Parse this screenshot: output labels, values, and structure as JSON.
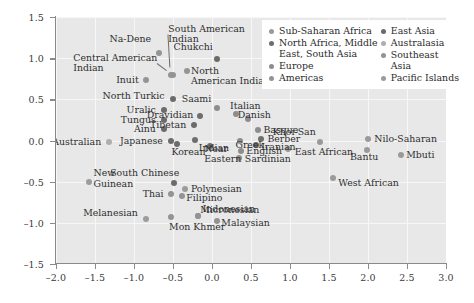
{
  "chart_data": {
    "type": "scatter",
    "title": "",
    "xlabel": "",
    "ylabel": "",
    "xlim": [
      -2.0,
      3.0
    ],
    "ylim": [
      -1.5,
      1.5
    ],
    "xticks": [
      "-2.0",
      "-1.5",
      "-1.0",
      "-0.5",
      "0.0",
      "0.5",
      "1.0",
      "1.5",
      "2.0",
      "2.5",
      "3.0"
    ],
    "yticks": [
      "1.5",
      "1.0",
      "0.5",
      "0.0",
      "-0.5",
      "-1.0",
      "-1.5"
    ],
    "grid": true,
    "legend_position": "top-right",
    "legend": [
      {
        "label": "Sub-Saharan Africa",
        "color": "#9a9a9a"
      },
      {
        "label": "North Africa, Middle\nEast, South Asia",
        "color": "#6e6e6e"
      },
      {
        "label": "Europe",
        "color": "#8d8d8d"
      },
      {
        "label": "Americas",
        "color": "#949494"
      },
      {
        "label": "East Asia",
        "color": "#6b6b6b"
      },
      {
        "label": "Australasia",
        "color": "#aeaeae"
      },
      {
        "label": "Southeast Asia",
        "color": "#939393"
      },
      {
        "label": "Pacific Islands",
        "color": "#9c9c9c"
      }
    ],
    "points": [
      {
        "label": "Na-Dene",
        "x": -0.68,
        "y": 1.06,
        "lx": -0.78,
        "ly": 1.23,
        "anchor": "r",
        "group": "Americas"
      },
      {
        "label": "South American\nIndian",
        "x": -0.53,
        "y": 0.8,
        "lx": -0.56,
        "ly": 1.29,
        "anchor": "l",
        "group": "Americas"
      },
      {
        "label": "Central American\nIndian",
        "x": -0.5,
        "y": 0.8,
        "lx": -0.7,
        "ly": 0.94,
        "anchor": "r",
        "group": "Americas"
      },
      {
        "label": "Inuit",
        "x": -0.85,
        "y": 0.74,
        "lx": -0.94,
        "ly": 0.74,
        "anchor": "r",
        "group": "Americas"
      },
      {
        "label": "Chukchi",
        "x": 0.06,
        "y": 0.99,
        "lx": 0.01,
        "ly": 1.13,
        "anchor": "r",
        "group": "East Asia"
      },
      {
        "label": "North\nAmerican Indian",
        "x": -0.32,
        "y": 0.85,
        "lx": -0.27,
        "ly": 0.78,
        "anchor": "l",
        "group": "Americas"
      },
      {
        "label": "North Turkic",
        "x": -0.5,
        "y": 0.51,
        "lx": -0.61,
        "ly": 0.54,
        "anchor": "r",
        "group": "East Asia"
      },
      {
        "label": "Saami",
        "x": 0.06,
        "y": 0.4,
        "lx": -0.01,
        "ly": 0.51,
        "anchor": "r",
        "group": "Europe"
      },
      {
        "label": "Italian",
        "x": 0.31,
        "y": 0.32,
        "lx": 0.23,
        "ly": 0.42,
        "anchor": "l",
        "group": "Europe"
      },
      {
        "label": "Danish",
        "x": 0.46,
        "y": 0.26,
        "lx": 0.33,
        "ly": 0.31,
        "anchor": "l",
        "group": "Europe"
      },
      {
        "label": "Uralic",
        "x": -0.62,
        "y": 0.37,
        "lx": -0.72,
        "ly": 0.37,
        "anchor": "r",
        "group": "East Asia"
      },
      {
        "label": "Dravidian",
        "x": -0.16,
        "y": 0.3,
        "lx": -0.24,
        "ly": 0.31,
        "anchor": "r",
        "group": "North Africa, Middle East, South Asia"
      },
      {
        "label": "Tungus",
        "x": -0.62,
        "y": 0.25,
        "lx": -0.72,
        "ly": 0.25,
        "anchor": "r",
        "group": "East Asia"
      },
      {
        "label": "Tibetan",
        "x": -0.23,
        "y": 0.19,
        "lx": -0.33,
        "ly": 0.19,
        "anchor": "r",
        "group": "East Asia"
      },
      {
        "label": "Ainu",
        "x": -0.62,
        "y": 0.14,
        "lx": -0.72,
        "ly": 0.14,
        "anchor": "r",
        "group": "East Asia"
      },
      {
        "label": "Basque",
        "x": 0.59,
        "y": 0.13,
        "lx": 0.66,
        "ly": 0.13,
        "anchor": "l",
        "group": "Europe"
      },
      {
        "label": "Berber",
        "x": 0.63,
        "y": 0.02,
        "lx": 0.71,
        "ly": 0.02,
        "anchor": "l",
        "group": "North Africa, Middle East, South Asia"
      },
      {
        "label": "Iranian",
        "x": 0.57,
        "y": -0.05,
        "lx": 0.63,
        "ly": -0.08,
        "anchor": "l",
        "group": "North Africa, Middle East, South Asia"
      },
      {
        "label": "Japanese",
        "x": -0.53,
        "y": 0.0,
        "lx": -0.63,
        "ly": 0.0,
        "anchor": "r",
        "group": "East Asia"
      },
      {
        "label": "Australian",
        "x": -1.32,
        "y": -0.02,
        "lx": -1.42,
        "ly": -0.02,
        "anchor": "r",
        "group": "Australasia"
      },
      {
        "label": "Indian",
        "x": -0.22,
        "y": 0.01,
        "lx": -0.17,
        "ly": -0.09,
        "anchor": "l",
        "group": "North Africa, Middle East, South Asia"
      },
      {
        "label": "Greek",
        "x": 0.36,
        "y": 0.0,
        "lx": 0.3,
        "ly": -0.06,
        "anchor": "l",
        "group": "Europe"
      },
      {
        "label": "Khoi-San",
        "x": 1.38,
        "y": -0.02,
        "lx": 1.33,
        "ly": 0.1,
        "anchor": "r",
        "group": "Sub-Saharan Africa"
      },
      {
        "label": "Nilo-Saharan",
        "x": 2.0,
        "y": 0.02,
        "lx": 2.08,
        "ly": 0.02,
        "anchor": "l",
        "group": "Sub-Saharan Africa"
      },
      {
        "label": "Korean",
        "x": -0.45,
        "y": -0.04,
        "lx": -0.52,
        "ly": -0.14,
        "anchor": "l",
        "group": "East Asia"
      },
      {
        "label": "Near\nEastern",
        "x": -0.02,
        "y": -0.07,
        "lx": -0.1,
        "ly": -0.16,
        "anchor": "l",
        "group": "North Africa, Middle East, South Asia"
      },
      {
        "label": "English",
        "x": 0.37,
        "y": -0.13,
        "lx": 0.44,
        "ly": -0.13,
        "anchor": "l",
        "group": "Europe"
      },
      {
        "label": "Sardinian",
        "x": 0.34,
        "y": -0.21,
        "lx": 0.42,
        "ly": -0.22,
        "anchor": "l",
        "group": "Europe"
      },
      {
        "label": "East African",
        "x": 0.98,
        "y": -0.1,
        "lx": 1.06,
        "ly": -0.14,
        "anchor": "l",
        "group": "Sub-Saharan Africa"
      },
      {
        "label": "Bantu",
        "x": 1.99,
        "y": -0.12,
        "lx": 1.95,
        "ly": -0.2,
        "anchor": "c",
        "group": "Sub-Saharan Africa"
      },
      {
        "label": "Mbuti",
        "x": 2.42,
        "y": -0.17,
        "lx": 2.49,
        "ly": -0.17,
        "anchor": "l",
        "group": "Sub-Saharan Africa"
      },
      {
        "label": "New\nGuinean",
        "x": -1.58,
        "y": -0.5,
        "lx": -1.52,
        "ly": -0.46,
        "anchor": "l",
        "group": "Pacific Islands"
      },
      {
        "label": "South Chinese",
        "x": -0.49,
        "y": -0.52,
        "lx": -0.42,
        "ly": -0.4,
        "anchor": "r",
        "group": "East Asia"
      },
      {
        "label": "Polynesian",
        "x": -0.34,
        "y": -0.59,
        "lx": -0.27,
        "ly": -0.59,
        "anchor": "l",
        "group": "Pacific Islands"
      },
      {
        "label": "Thai",
        "x": -0.53,
        "y": -0.65,
        "lx": -0.62,
        "ly": -0.65,
        "anchor": "r",
        "group": "Southeast Asia"
      },
      {
        "label": "Filipino",
        "x": -0.38,
        "y": -0.68,
        "lx": -0.33,
        "ly": -0.7,
        "anchor": "l",
        "group": "Southeast Asia"
      },
      {
        "label": "West African",
        "x": 1.55,
        "y": -0.45,
        "lx": 1.62,
        "ly": -0.52,
        "anchor": "l",
        "group": "Sub-Saharan Africa"
      },
      {
        "label": "Micronesian",
        "x": -0.18,
        "y": -0.92,
        "lx": -0.15,
        "ly": -0.84,
        "anchor": "l",
        "group": "Pacific Islands"
      },
      {
        "label": "Indonesian",
        "x": -0.18,
        "y": -0.92,
        "lx": -0.12,
        "ly": -0.83,
        "anchor": "l",
        "group": "Southeast Asia"
      },
      {
        "label": "Melanesian",
        "x": -0.85,
        "y": -0.95,
        "lx": -0.95,
        "ly": -0.88,
        "anchor": "r",
        "group": "Pacific Islands"
      },
      {
        "label": "Mon Khmer",
        "x": -0.52,
        "y": -0.93,
        "lx": -0.55,
        "ly": -1.05,
        "anchor": "l",
        "group": "Southeast Asia"
      },
      {
        "label": "Malaysian",
        "x": 0.06,
        "y": -0.98,
        "lx": 0.12,
        "ly": -1.0,
        "anchor": "l",
        "group": "Southeast Asia"
      }
    ]
  }
}
